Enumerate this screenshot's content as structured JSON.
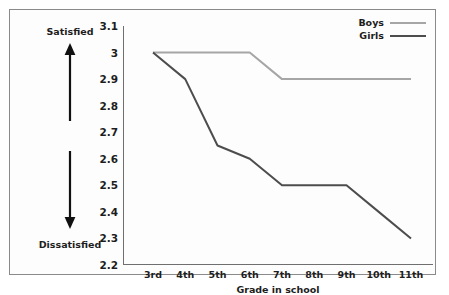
{
  "chart_data": {
    "type": "line",
    "title": "",
    "xlabel": "Grade in school",
    "ylabel": "",
    "categories": [
      "3rd",
      "4th",
      "5th",
      "6th",
      "7th",
      "8th",
      "9th",
      "10th",
      "11th"
    ],
    "series": [
      {
        "name": "Boys",
        "color": "#a6a6a6",
        "values": [
          3.0,
          3.0,
          3.0,
          3.0,
          2.9,
          2.9,
          2.9,
          2.9,
          2.9
        ]
      },
      {
        "name": "Girls",
        "color": "#4d4d4d",
        "values": [
          3.0,
          2.9,
          2.65,
          2.6,
          2.5,
          2.5,
          2.5,
          2.4,
          2.3
        ]
      }
    ],
    "ylim": [
      2.2,
      3.1
    ],
    "yticks": [
      "3.1",
      "3",
      "2.9",
      "2.8",
      "2.7",
      "2.6",
      "2.5",
      "2.4",
      "2.3",
      "2.2"
    ],
    "ytick_values": [
      3.1,
      3.0,
      2.9,
      2.8,
      2.7,
      2.6,
      2.5,
      2.4,
      2.3,
      2.2
    ],
    "grid": false,
    "legend_position": "top-right"
  },
  "annotations": {
    "satisfied_label": "Satisfied",
    "dissatisfied_label": "Dissatisfied",
    "arrow_up_name": "arrow-up-icon",
    "arrow_down_name": "arrow-down-icon"
  },
  "colors": {
    "boys": "#a6a6a6",
    "girls": "#4d4d4d",
    "axis": "#6f6f6f",
    "border": "#8a8a8a",
    "text": "#1d1d1d",
    "background": "#fdfdfd"
  }
}
